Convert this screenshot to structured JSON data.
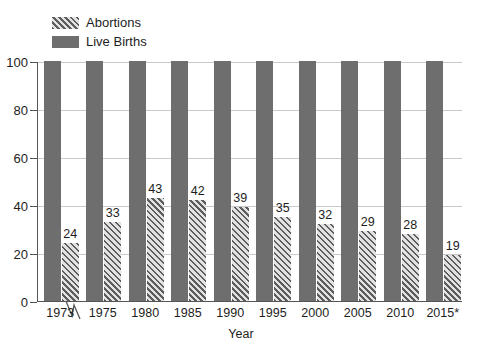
{
  "chart_data": {
    "type": "bar",
    "title": "",
    "xlabel": "Year",
    "ylabel": "",
    "ylim": [
      0,
      100
    ],
    "yticks": [
      0,
      20,
      40,
      60,
      80,
      100
    ],
    "grid": true,
    "legend_position": "top-left-inside",
    "categories": [
      "1973",
      "1975",
      "1980",
      "1985",
      "1990",
      "1995",
      "2000",
      "2005",
      "2010",
      "2015*"
    ],
    "series": [
      {
        "name": "Live Births",
        "style": "solid",
        "color": "#6e6e6e",
        "values": [
          100,
          100,
          100,
          100,
          100,
          100,
          100,
          100,
          100,
          100
        ],
        "show_labels": false
      },
      {
        "name": "Abortions",
        "style": "diagonal-hatch",
        "color": "#cfcfcf",
        "hatch_color": "#5d5d5d",
        "values": [
          24,
          33,
          43,
          42,
          39,
          35,
          32,
          29,
          28,
          19
        ],
        "show_labels": true
      }
    ],
    "annotations": [
      {
        "name": "x-axis-break",
        "between": [
          "1973",
          "1975"
        ],
        "symbol": "zigzag"
      }
    ]
  },
  "legend": {
    "items": [
      {
        "label": "Abortions",
        "swatch": "hatch-swatch-icon"
      },
      {
        "label": "Live Births",
        "swatch": "solid-swatch-icon"
      }
    ]
  },
  "axes": {
    "y_tick_labels": [
      "100",
      "80",
      "60",
      "40",
      "20",
      "0"
    ],
    "x_tick_labels": [
      "1973",
      "1975",
      "1980",
      "1985",
      "1990",
      "1995",
      "2000",
      "2005",
      "2010",
      "2015*"
    ],
    "x_axis_title": "Year"
  },
  "bar_labels": [
    "24",
    "33",
    "43",
    "42",
    "39",
    "35",
    "32",
    "29",
    "28",
    "19"
  ]
}
